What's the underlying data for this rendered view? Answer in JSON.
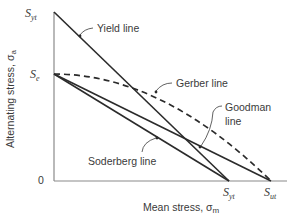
{
  "diagram": {
    "type": "fatigue-failure-criteria",
    "axes": {
      "y_label": "Alternating stress, σ",
      "y_label_sub": "a",
      "x_label": "Mean stress, σ",
      "x_label_sub": "m",
      "origin_label": "0"
    },
    "y_ticks": [
      {
        "main": "S",
        "sub": "yt",
        "id": "syt-y"
      },
      {
        "main": "S",
        "sub": "e",
        "id": "se"
      }
    ],
    "x_ticks": [
      {
        "main": "S",
        "sub": "yt",
        "id": "syt-x"
      },
      {
        "main": "S",
        "sub": "ut",
        "id": "sut"
      }
    ],
    "lines": [
      {
        "id": "yield",
        "label": "Yield line",
        "style": "solid",
        "from": "Syt (y-axis)",
        "to": "Syt (x-axis)"
      },
      {
        "id": "gerber",
        "label": "Gerber line",
        "style": "dashed-parabola",
        "from": "Se",
        "to": "Sut"
      },
      {
        "id": "goodman",
        "label_line1": "Goodman",
        "label_line2": "line",
        "style": "solid",
        "from": "Se",
        "to": "Sut"
      },
      {
        "id": "soderberg",
        "label": "Soderberg line",
        "style": "solid",
        "from": "Se",
        "to": "Syt (x-axis)"
      }
    ]
  }
}
